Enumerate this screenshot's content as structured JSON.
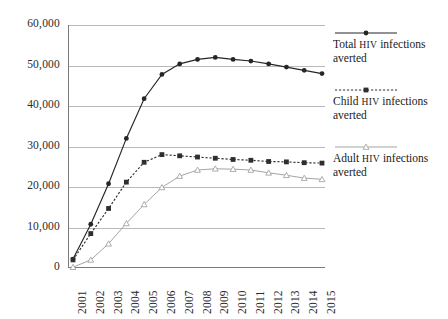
{
  "chart_data": {
    "type": "line",
    "title": "",
    "xlabel": "",
    "ylabel": "",
    "grid": true,
    "legend_position": "right",
    "categories": [
      "2001",
      "2002",
      "2003",
      "2004",
      "2005",
      "2006",
      "2007",
      "2008",
      "2009",
      "2010",
      "2011",
      "2012",
      "2013",
      "2014",
      "2015"
    ],
    "ylim": [
      0,
      60000
    ],
    "yticks": [
      0,
      10000,
      20000,
      30000,
      40000,
      50000,
      60000
    ],
    "ytick_labels": [
      "0",
      "10,000",
      "20,000",
      "30,000",
      "40,000",
      "50,000",
      "60,000"
    ],
    "series": [
      {
        "name": "Total HIV infections averted",
        "marker": "filled-circle",
        "line": "solid",
        "color": "#262626",
        "values": [
          2200,
          10800,
          20800,
          32000,
          41800,
          47800,
          50400,
          51500,
          52000,
          51500,
          51100,
          50400,
          49600,
          48800,
          48000
        ]
      },
      {
        "name": "Child HIV infections averted",
        "marker": "filled-square",
        "line": "dotted",
        "color": "#2e2e2e",
        "values": [
          2000,
          8500,
          14700,
          21200,
          26100,
          28000,
          27700,
          27400,
          27100,
          26800,
          26600,
          26300,
          26200,
          26000,
          25900
        ]
      },
      {
        "name": "Adult HIV infections averted",
        "marker": "open-triangle",
        "line": "solid-thin",
        "color": "#9a9a9a",
        "values": [
          200,
          2000,
          6000,
          11000,
          15700,
          19900,
          22700,
          24200,
          24500,
          24400,
          24200,
          23500,
          22900,
          22200,
          21900
        ]
      }
    ]
  },
  "legend": {
    "items": [
      {
        "prefix": "Total ",
        "caps": "HIV",
        "suffix": " infections averted"
      },
      {
        "prefix": "Child ",
        "caps": "HIV",
        "suffix": " infections averted"
      },
      {
        "prefix": "Adult ",
        "caps": "HIV",
        "suffix": " infections averted"
      }
    ]
  },
  "colors": {
    "total": "#262626",
    "child": "#2e2e2e",
    "adult": "#9a9a9a",
    "gridline": "#b9b9b9",
    "axis": "#7a7a7a",
    "background": "#ffffff"
  }
}
